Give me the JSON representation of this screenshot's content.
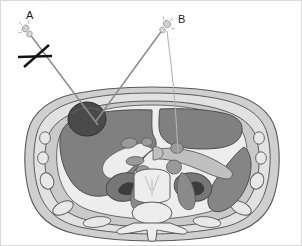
{
  "figure": {
    "width": 302,
    "height": 246
  },
  "labels": {
    "probe_a": "A",
    "probe_b": "B"
  },
  "annotations": {
    "path_a_name": "needle-path-a",
    "path_a_status": "rejected",
    "path_b_name": "needle-path-b",
    "path_b_status": "accepted",
    "cross_mark": "X"
  },
  "colors": {
    "background": "#ffffff",
    "frame": "#d9d9d9",
    "skin_outer": "#cfcfcf",
    "subcutaneous_fat": "#e2e2e2",
    "muscle_wall": "#cacaca",
    "peritoneal_fat": "#ededed",
    "liver": "#808080",
    "lesion": "#4a4a4a",
    "spleen": "#858585",
    "kidney": "#777777",
    "kidney_hilum": "#3d3d3d",
    "vessel": "#9a9a9a",
    "bone": "#e8e8e8",
    "rib": "#e3e3e3",
    "vertebra": "#ededed",
    "stroke": "#5a5a5a",
    "needle": "#8f8f8f",
    "needle_hub": "#d0d0d0",
    "cross_stroke": "#141414",
    "label": "#1a1a1a"
  },
  "anatomy": {
    "structures": [
      {
        "name": "body-wall-skin",
        "label": "Skin / body contour"
      },
      {
        "name": "subcutaneous-fat-layer",
        "label": "Subcutaneous fat"
      },
      {
        "name": "abdominal-muscle-wall",
        "label": "Abdominal wall musculature"
      },
      {
        "name": "rib-segment",
        "label": "Rib",
        "count": 8
      },
      {
        "name": "liver",
        "label": "Liver"
      },
      {
        "name": "liver-lesion",
        "label": "Focal hepatic lesion"
      },
      {
        "name": "stomach",
        "label": "Stomach"
      },
      {
        "name": "spleen",
        "label": "Spleen"
      },
      {
        "name": "pancreas",
        "label": "Pancreas"
      },
      {
        "name": "aorta",
        "label": "Aorta"
      },
      {
        "name": "inferior-vena-cava",
        "label": "Inferior vena cava"
      },
      {
        "name": "right-kidney",
        "label": "Right kidney"
      },
      {
        "name": "left-kidney",
        "label": "Left kidney"
      },
      {
        "name": "vertebral-body",
        "label": "Vertebral body"
      },
      {
        "name": "spinal-canal",
        "label": "Spinal canal"
      },
      {
        "name": "spinous-process",
        "label": "Spinous process"
      },
      {
        "name": "paraspinal-muscle",
        "label": "Paraspinal muscle"
      }
    ]
  },
  "geometry": {
    "needle_a": {
      "x1": 28,
      "y1": 32,
      "x2": 95,
      "y2": 122
    },
    "needle_b": {
      "x1": 163,
      "y1": 27,
      "x2": 95,
      "y2": 120
    },
    "needle_c": {
      "x1": 168,
      "y1": 30,
      "x2": 178,
      "y2": 152
    },
    "hub_a": {
      "cx": 26,
      "cy": 30
    },
    "hub_b": {
      "cx": 165,
      "cy": 25
    },
    "cross_h": {
      "x1": 17,
      "y1": 56,
      "x2": 51,
      "y2": 55
    },
    "cross_d": {
      "x1": 23,
      "y1": 66,
      "x2": 48,
      "y2": 44
    },
    "label_a": {
      "x": 25,
      "y": 17
    },
    "label_b": {
      "x": 178,
      "y": 21
    },
    "lesion": {
      "cx": 86,
      "cy": 118,
      "rx": 19,
      "ry": 17
    }
  }
}
